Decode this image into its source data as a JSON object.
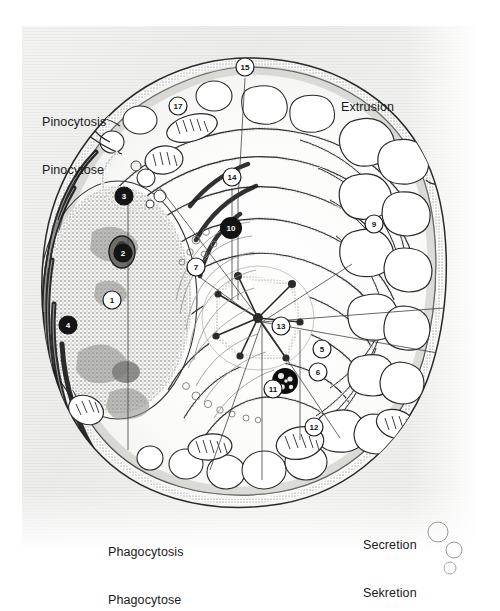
{
  "figure": {
    "background_color": "#f1f1ef",
    "ink_color": "#1a1a1a",
    "paper_color": "#ffffff"
  },
  "process_labels": [
    {
      "id": "pinocytosis",
      "line1": "Pinocytosis",
      "line2": "Pinocytose",
      "x": 42,
      "y": 82
    },
    {
      "id": "extrusion",
      "line1": "Extrusion",
      "line2": "",
      "x": 341,
      "y": 70
    },
    {
      "id": "phagocytosis",
      "line1": "Phagocytosis",
      "line2": "Phagocytose",
      "x": 108,
      "y": 512
    },
    {
      "id": "secretion",
      "line1": "Secretion",
      "line2": "Sekretion",
      "x": 363,
      "y": 505
    }
  ],
  "callouts": [
    {
      "n": "1",
      "x": 112,
      "y": 300,
      "style": "light",
      "part": "nucleus"
    },
    {
      "n": "2",
      "x": 123,
      "y": 253,
      "style": "dark",
      "part": "nucleolus"
    },
    {
      "n": "3",
      "x": 124,
      "y": 196,
      "style": "dark",
      "part": "nuclear-pore-upper"
    },
    {
      "n": "4",
      "x": 68,
      "y": 325,
      "style": "dark",
      "part": "nuclear-pore-left"
    },
    {
      "n": "5",
      "x": 322,
      "y": 349,
      "style": "light",
      "part": "rough-er-outer"
    },
    {
      "n": "6",
      "x": 318,
      "y": 372,
      "style": "light",
      "part": "ribosome-strand"
    },
    {
      "n": "7",
      "x": 196,
      "y": 267,
      "style": "light",
      "part": "smooth-er"
    },
    {
      "n": "9",
      "x": 374,
      "y": 224,
      "style": "light",
      "part": "vacuole-field"
    },
    {
      "n": "10",
      "x": 231,
      "y": 228,
      "style": "dark",
      "part": "lysosome-upper"
    },
    {
      "n": "11",
      "x": 273,
      "y": 389,
      "style": "light",
      "part": "lysosome-lower"
    },
    {
      "n": "12",
      "x": 314,
      "y": 427,
      "style": "light",
      "part": "mitochondrion"
    },
    {
      "n": "13",
      "x": 281,
      "y": 326,
      "style": "light",
      "part": "centriole-golgi"
    },
    {
      "n": "14",
      "x": 232,
      "y": 177,
      "style": "light",
      "part": "cytoplasm-matrix"
    },
    {
      "n": "15",
      "x": 245,
      "y": 67,
      "style": "light",
      "part": "cell-membrane"
    },
    {
      "n": "17",
      "x": 178,
      "y": 106,
      "style": "light",
      "part": "ectoplasm-zone"
    }
  ]
}
